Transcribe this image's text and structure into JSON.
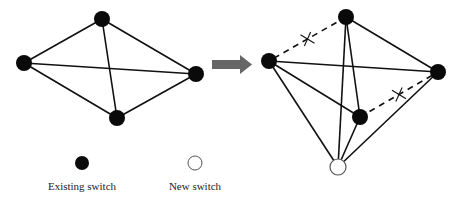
{
  "diagram": {
    "colors": {
      "existing_node": "#0a0a0a",
      "new_node_fill": "#ffffff",
      "new_node_stroke": "#555555",
      "edge": "#111111",
      "arrow": "#666666"
    },
    "before": {
      "nodes": [
        {
          "id": "top",
          "type": "existing"
        },
        {
          "id": "left",
          "type": "existing"
        },
        {
          "id": "right",
          "type": "existing"
        },
        {
          "id": "bottom",
          "type": "existing"
        }
      ],
      "edges": [
        {
          "from": "top",
          "to": "left",
          "style": "solid"
        },
        {
          "from": "top",
          "to": "right",
          "style": "solid"
        },
        {
          "from": "top",
          "to": "bottom",
          "style": "solid"
        },
        {
          "from": "left",
          "to": "right",
          "style": "solid"
        },
        {
          "from": "left",
          "to": "bottom",
          "style": "solid"
        },
        {
          "from": "right",
          "to": "bottom",
          "style": "solid"
        }
      ]
    },
    "after": {
      "nodes": [
        {
          "id": "top",
          "type": "existing"
        },
        {
          "id": "left",
          "type": "existing"
        },
        {
          "id": "right",
          "type": "existing"
        },
        {
          "id": "mid",
          "type": "existing"
        },
        {
          "id": "new",
          "type": "new"
        }
      ],
      "edges": [
        {
          "from": "top",
          "to": "left",
          "style": "dashed",
          "removed": true
        },
        {
          "from": "top",
          "to": "right",
          "style": "solid"
        },
        {
          "from": "top",
          "to": "mid",
          "style": "solid"
        },
        {
          "from": "top",
          "to": "new",
          "style": "solid"
        },
        {
          "from": "left",
          "to": "right",
          "style": "solid"
        },
        {
          "from": "left",
          "to": "mid",
          "style": "solid"
        },
        {
          "from": "left",
          "to": "new",
          "style": "solid"
        },
        {
          "from": "mid",
          "to": "right",
          "style": "dashed",
          "removed": true
        },
        {
          "from": "mid",
          "to": "new",
          "style": "solid"
        },
        {
          "from": "right",
          "to": "new",
          "style": "solid"
        }
      ]
    },
    "legend": {
      "existing_label": "Existing switch",
      "new_label": "New switch"
    }
  }
}
